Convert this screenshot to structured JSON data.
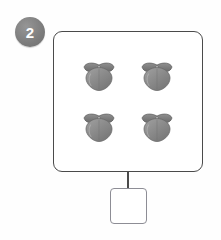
{
  "page": {
    "background_color": "#fefefe",
    "width": 221,
    "height": 240
  },
  "question": {
    "number": "2",
    "badge_color": "#7c7c7c",
    "badge_text_color": "#ffffff"
  },
  "group_box": {
    "border_color": "#4a4a4a",
    "fill_color": "#ffffff",
    "item_icon_name": "peach-fruit-icon",
    "item_count": 4,
    "item_color": "#8a8a8a",
    "item_leaf_color": "#6f6f6f",
    "items": [
      {
        "label": "peach 1"
      },
      {
        "label": "peach 2"
      },
      {
        "label": "peach 3"
      },
      {
        "label": "peach 4"
      }
    ]
  },
  "connector": {
    "color": "#4a4a4a"
  },
  "answer_box": {
    "value": "",
    "placeholder": "",
    "border_color": "#8d8d95",
    "fill_color": "#ffffff"
  }
}
